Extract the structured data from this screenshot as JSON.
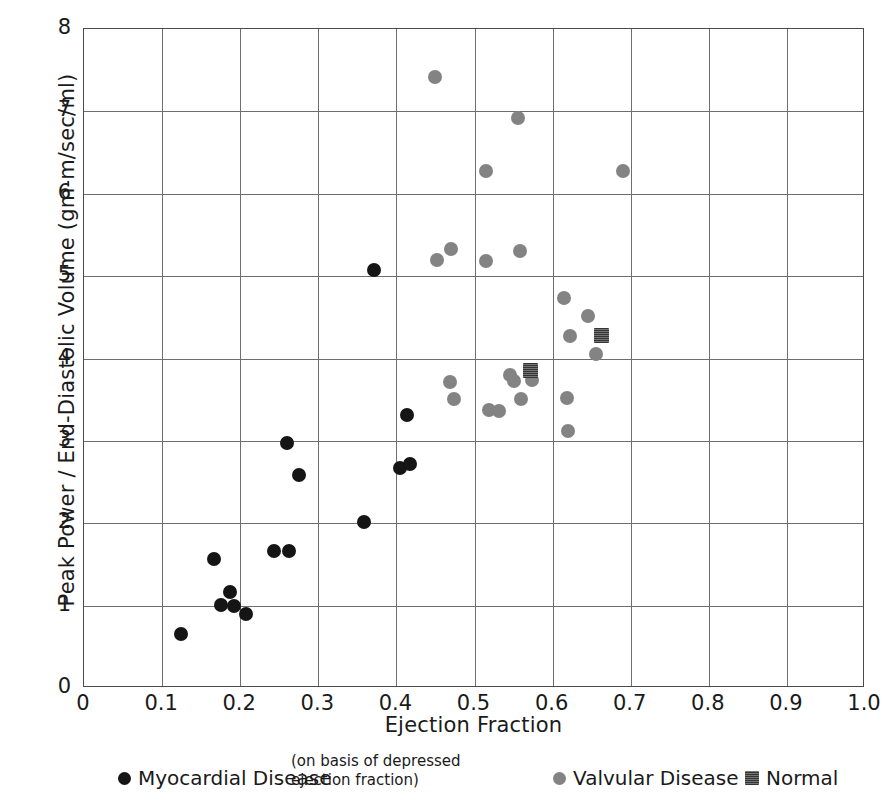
{
  "chart_data": {
    "type": "scatter",
    "title": "",
    "xlabel": "Ejection Fraction",
    "ylabel": "Peak Power / End-Diastolic Volume (gm-m/sec/ml)",
    "xlim": [
      0,
      1.0
    ],
    "ylim": [
      0,
      8
    ],
    "xticks": [
      "0",
      "0.1",
      "0.2",
      "0.3",
      "0.4",
      "0.5",
      "0.6",
      "0.7",
      "0.8",
      "0.9",
      "1.0"
    ],
    "xtick_values": [
      0,
      0.1,
      0.2,
      0.3,
      0.4,
      0.5,
      0.6,
      0.7,
      0.8,
      0.9,
      1.0
    ],
    "yticks": [
      "0",
      "1",
      "2",
      "3",
      "4",
      "5",
      "6",
      "7",
      "8"
    ],
    "ytick_values": [
      0,
      1,
      2,
      3,
      4,
      5,
      6,
      7,
      8
    ],
    "grid": true,
    "legend_position": "below-plot",
    "colors": {
      "myocardial": "#151515",
      "valvular": "#838383",
      "normal": "#5a5a5a",
      "axis": "#4a4a4a",
      "grid": "#6e6e6e",
      "background": "#ffffff"
    },
    "series": [
      {
        "name": "Myocardial Disease",
        "marker": "circle",
        "color": "#151515",
        "points": [
          [
            0.124,
            0.66
          ],
          [
            0.166,
            1.56
          ],
          [
            0.175,
            1.01
          ],
          [
            0.187,
            1.17
          ],
          [
            0.192,
            1.0
          ],
          [
            0.207,
            0.9
          ],
          [
            0.243,
            1.66
          ],
          [
            0.262,
            1.66
          ],
          [
            0.26,
            2.97
          ],
          [
            0.275,
            2.58
          ],
          [
            0.358,
            2.02
          ],
          [
            0.371,
            5.07
          ],
          [
            0.404,
            2.67
          ],
          [
            0.414,
            3.32
          ],
          [
            0.418,
            2.72
          ]
        ]
      },
      {
        "name": "Valvular Disease",
        "marker": "circle",
        "color": "#838383",
        "points": [
          [
            0.45,
            7.42
          ],
          [
            0.452,
            5.2
          ],
          [
            0.47,
            5.33
          ],
          [
            0.468,
            3.72
          ],
          [
            0.474,
            3.51
          ],
          [
            0.515,
            6.28
          ],
          [
            0.515,
            5.18
          ],
          [
            0.518,
            3.37
          ],
          [
            0.532,
            3.36
          ],
          [
            0.545,
            3.8
          ],
          [
            0.55,
            3.73
          ],
          [
            0.556,
            6.92
          ],
          [
            0.558,
            5.31
          ],
          [
            0.56,
            3.51
          ],
          [
            0.573,
            3.74
          ],
          [
            0.614,
            4.73
          ],
          [
            0.618,
            3.52
          ],
          [
            0.622,
            4.27
          ],
          [
            0.62,
            3.12
          ],
          [
            0.645,
            4.51
          ],
          [
            0.655,
            4.06
          ],
          [
            0.69,
            6.28
          ]
        ]
      },
      {
        "name": "Normal",
        "marker": "square",
        "color": "#5a5a5a",
        "points": [
          [
            0.572,
            3.86
          ],
          [
            0.663,
            4.28
          ]
        ]
      }
    ]
  },
  "legend": {
    "items": [
      {
        "label": "Myocardial Disease",
        "marker": "circle",
        "style": "myo"
      },
      {
        "label": "Valvular Disease",
        "marker": "circle",
        "style": "val"
      },
      {
        "label": "Normal",
        "marker": "square",
        "style": "norm"
      }
    ],
    "note": "(on basis of depressed\nejection fraction)"
  }
}
